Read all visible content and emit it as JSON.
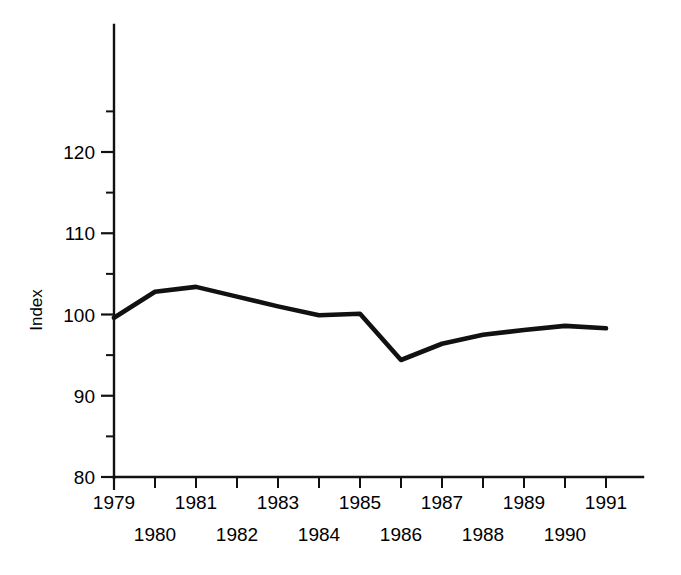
{
  "chart_data": {
    "type": "line",
    "title": "",
    "subtitle": "",
    "xlabel": "",
    "ylabel": "Index",
    "x": [
      1979,
      1980,
      1981,
      1982,
      1983,
      1984,
      1985,
      1986,
      1987,
      1988,
      1989,
      1990,
      1991
    ],
    "categories": [
      "1979",
      "1980",
      "1981",
      "1982",
      "1983",
      "1984",
      "1985",
      "1986",
      "1987",
      "1988",
      "1989",
      "1990",
      "1991"
    ],
    "values": [
      99.6,
      102.8,
      103.4,
      102.2,
      101.0,
      99.9,
      100.1,
      94.4,
      96.4,
      97.5,
      98.1,
      98.6,
      98.3
    ],
    "series": [
      {
        "name": "Index",
        "values": [
          99.6,
          102.8,
          103.4,
          102.2,
          101.0,
          99.9,
          100.1,
          94.4,
          96.4,
          97.5,
          98.1,
          98.6,
          98.3
        ],
        "color": "#111111"
      }
    ],
    "xlim": [
      1979,
      1991
    ],
    "ylim": [
      80,
      125
    ],
    "ytick_labels": [
      "80",
      "90",
      "100",
      "110",
      "120"
    ],
    "ytick_values": [
      80,
      90,
      100,
      110,
      120
    ],
    "yminor_values": [
      85,
      95,
      105,
      115,
      125
    ],
    "xtick_values": [
      1979,
      1980,
      1981,
      1982,
      1983,
      1984,
      1985,
      1986,
      1987,
      1988,
      1989,
      1990,
      1991
    ],
    "xtick_labels_top": [
      "1979",
      "1981",
      "1983",
      "1985",
      "1987",
      "1989",
      "1991"
    ],
    "xtick_labels_bottom": [
      "1980",
      "1982",
      "1984",
      "1986",
      "1988",
      "1990"
    ],
    "grid": false,
    "legend": false,
    "legend_position": "none",
    "line_color": "#111111",
    "background_color": "#ffffff"
  },
  "axes": {
    "y_label": "Index"
  }
}
